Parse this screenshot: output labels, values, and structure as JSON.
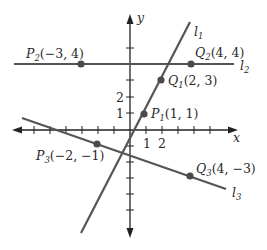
{
  "diagram": {
    "type": "coordinate-plane",
    "axes": {
      "x_label": "x",
      "y_label": "y",
      "x_tick_labels": [
        "1",
        "2"
      ],
      "y_tick_labels": [
        "1",
        "2"
      ]
    },
    "lines": [
      {
        "name": "l1",
        "label_base": "l",
        "label_sub": "1",
        "through": [
          "P1",
          "Q1"
        ]
      },
      {
        "name": "l2",
        "label_base": "l",
        "label_sub": "2",
        "through": [
          "P2",
          "Q2"
        ]
      },
      {
        "name": "l3",
        "label_base": "l",
        "label_sub": "3",
        "through": [
          "P3",
          "Q3"
        ]
      }
    ],
    "points": [
      {
        "id": "P1",
        "base": "P",
        "sub": "1",
        "coords": "(1, 1)",
        "x": 1,
        "y": 1
      },
      {
        "id": "Q1",
        "base": "Q",
        "sub": "1",
        "coords": "(2, 3)",
        "x": 2,
        "y": 3
      },
      {
        "id": "P2",
        "base": "P",
        "sub": "2",
        "coords": "(−3, 4)",
        "x": -3,
        "y": 4
      },
      {
        "id": "Q2",
        "base": "Q",
        "sub": "2",
        "coords": "(4, 4)",
        "x": 4,
        "y": 4
      },
      {
        "id": "P3",
        "base": "P",
        "sub": "3",
        "coords": "(−2, −1)",
        "x": -2,
        "y": -1
      },
      {
        "id": "Q3",
        "base": "Q",
        "sub": "3",
        "coords": "(4, −3)",
        "x": 4,
        "y": -3
      }
    ],
    "colors": {
      "line": "#555555",
      "axis": "#222222",
      "point": "#4a4a4a",
      "text": "#2a2a2a"
    }
  }
}
